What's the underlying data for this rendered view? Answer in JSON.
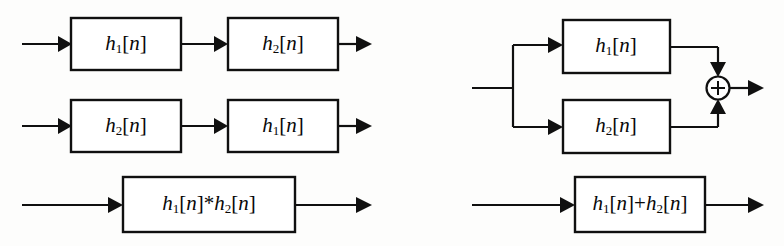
{
  "figure": {
    "background_color": "#fdfdfc",
    "line_color": "#101010",
    "box_fill": "#ffffff"
  },
  "labels": {
    "h1": "h",
    "h1_sub": "1",
    "h2": "h",
    "h2_sub": "2",
    "bracket_open": "[",
    "bracket_n": "n",
    "bracket_close": "]",
    "conv_operator": "*",
    "sum_operator": "+",
    "adder_symbol": "+"
  },
  "left_diagram": {
    "name": "cascade-equivalence",
    "rows": [
      {
        "name": "cascade-row-1",
        "blocks": [
          {
            "name": "block-h1",
            "text": "h₁[n]"
          },
          {
            "name": "block-h2",
            "text": "h₂[n]"
          }
        ]
      },
      {
        "name": "cascade-row-2",
        "blocks": [
          {
            "name": "block-h2",
            "text": "h₂[n]"
          },
          {
            "name": "block-h1",
            "text": "h₁[n]"
          }
        ]
      },
      {
        "name": "convolution-row",
        "blocks": [
          {
            "name": "block-convolution",
            "text": "h₁[n]*h₂[n]"
          }
        ]
      }
    ]
  },
  "right_diagram": {
    "name": "parallel-equivalence",
    "rows": [
      {
        "name": "parallel-row",
        "blocks": [
          {
            "name": "block-h1",
            "text": "h₁[n]"
          },
          {
            "name": "block-h2",
            "text": "h₂[n]"
          }
        ],
        "adder": {
          "name": "summing-junction",
          "symbol": "+"
        }
      },
      {
        "name": "sum-row",
        "blocks": [
          {
            "name": "block-sum",
            "text": "h₁[n]+h₂[n]"
          }
        ]
      }
    ]
  }
}
